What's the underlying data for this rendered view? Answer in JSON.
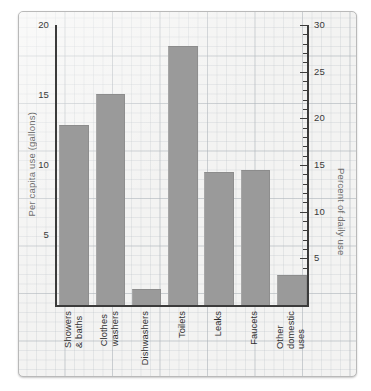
{
  "chart_data": {
    "type": "bar",
    "title": "",
    "xlabel": "",
    "ylabel": "Per capita use (gallons)",
    "y2label": "Percent of daily use",
    "categories": [
      "Showers\n& baths",
      "Clothes\nwashers",
      "Dishwashers",
      "Toilets",
      "Leaks",
      "Faucets",
      "Other\ndomestic\nuses"
    ],
    "values": [
      12.8,
      15.0,
      1.1,
      18.4,
      9.4,
      9.6,
      2.1
    ],
    "values_percent": [
      19.4,
      22.7,
      1.7,
      27.9,
      14.2,
      14.5,
      3.2
    ],
    "ylim": [
      0,
      20
    ],
    "y2lim": [
      0,
      30
    ],
    "yticks": [
      5,
      10,
      15,
      20
    ],
    "y2ticks": [
      5,
      10,
      15,
      20,
      25,
      30
    ],
    "y2_minor_step": 1,
    "grid": true,
    "grid_style": "graph-paper",
    "legend": "none",
    "bar_color": "#9a9a9a",
    "axis_color": "#3b3b3b",
    "label_color": "#6e6e6e",
    "background": "#f3f3f2"
  },
  "axes": {
    "left": {
      "title": "Per capita use (gallons)",
      "ticks": [
        {
          "label": "20",
          "value": 20
        },
        {
          "label": "15",
          "value": 15
        },
        {
          "label": "10",
          "value": 10
        },
        {
          "label": "5",
          "value": 5
        }
      ]
    },
    "right": {
      "title": "Percent of daily use",
      "ticks": [
        {
          "label": "30",
          "value": 30
        },
        {
          "label": "25",
          "value": 25
        },
        {
          "label": "20",
          "value": 20
        },
        {
          "label": "15",
          "value": 15
        },
        {
          "label": "10",
          "value": 10
        },
        {
          "label": "5",
          "value": 5
        }
      ]
    }
  },
  "bars": [
    {
      "label": "Showers\n& baths",
      "gallons": 12.8,
      "percent": 19.4
    },
    {
      "label": "Clothes\nwashers",
      "gallons": 15.0,
      "percent": 22.7
    },
    {
      "label": "Dishwashers",
      "gallons": 1.1,
      "percent": 1.7
    },
    {
      "label": "Toilets",
      "gallons": 18.4,
      "percent": 27.9
    },
    {
      "label": "Leaks",
      "gallons": 9.4,
      "percent": 14.2
    },
    {
      "label": "Faucets",
      "gallons": 9.6,
      "percent": 14.5
    },
    {
      "label": "Other\ndomestic\nuses",
      "gallons": 2.1,
      "percent": 3.2
    }
  ]
}
